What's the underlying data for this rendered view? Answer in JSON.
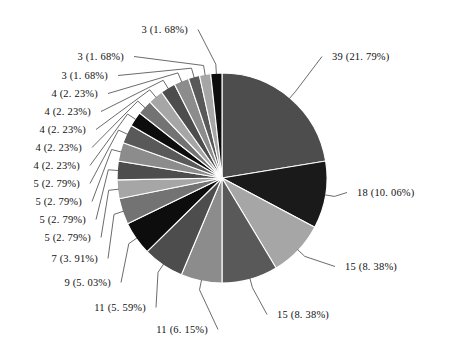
{
  "chart_data": {
    "type": "pie",
    "title": "",
    "subtitle": "",
    "xlabel": "",
    "ylabel": "",
    "legend_position": "none",
    "grid": false,
    "total": 179,
    "label_format": "count (percent%)",
    "start_angle_deg": 0,
    "direction": "clockwise",
    "categories": [
      "slice-1",
      "slice-2",
      "slice-3",
      "slice-4",
      "slice-5",
      "slice-6",
      "slice-7",
      "slice-8",
      "slice-9",
      "slice-10",
      "slice-11",
      "slice-12",
      "slice-13",
      "slice-14",
      "slice-15",
      "slice-16",
      "slice-17",
      "slice-18",
      "slice-19",
      "slice-20"
    ],
    "values": [
      39,
      18,
      15,
      15,
      11,
      11,
      9,
      7,
      5,
      5,
      5,
      5,
      4,
      4,
      4,
      4,
      4,
      3,
      3,
      3
    ],
    "percents": [
      21.79,
      10.06,
      8.38,
      8.38,
      6.15,
      5.59,
      5.03,
      3.91,
      2.79,
      2.79,
      2.79,
      2.79,
      2.23,
      2.23,
      2.23,
      2.23,
      2.23,
      1.68,
      1.68,
      1.68
    ],
    "colors": [
      "#4d4d4d",
      "#1a1a1a",
      "#a6a6a6",
      "#595959",
      "#8c8c8c",
      "#4d4d4d",
      "#0d0d0d",
      "#737373",
      "#a6a6a6",
      "#4d4d4d",
      "#8c8c8c",
      "#595959",
      "#0d0d0d",
      "#737373",
      "#a6a6a6",
      "#4d4d4d",
      "#8c8c8c",
      "#595959",
      "#a6a6a6",
      "#0d0d0d"
    ],
    "labels": [
      "39 (21. 79%)",
      "18 (10. 06%)",
      "15 (8. 38%)",
      "15 (8. 38%)",
      "11 (6. 15%)",
      "11 (5. 59%)",
      "9 (5. 03%)",
      "7 (3. 91%)",
      "5 (2. 79%)",
      "5 (2. 79%)",
      "5 (2. 79%)",
      "5 (2. 79%)",
      "4 (2. 23%)",
      "4 (2. 23%)",
      "4 (2. 23%)",
      "4 (2. 23%)",
      "4 (2. 23%)",
      "3 (1. 68%)",
      "3 (1. 68%)",
      "3 (1. 68%)"
    ]
  },
  "geometry": {
    "center_x": 222,
    "center_y": 178,
    "radius": 105
  },
  "colors": {
    "background": "#ffffff",
    "slice_border": "#ffffff",
    "leader_line": "#5a5a5a",
    "label_text": "#111111"
  }
}
